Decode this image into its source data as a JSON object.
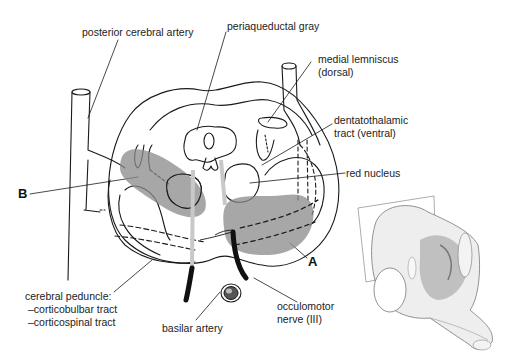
{
  "figure": {
    "labels": {
      "posterior_cerebral_artery": "posterior cerebral artery",
      "periaqueductal_gray": "periaqueductal gray",
      "medial_lemniscus_1": "medial lemniscus",
      "medial_lemniscus_2": "(dorsal)",
      "dentatothalamic_1": "dentatothalamic",
      "dentatothalamic_2": "tract (ventral)",
      "red_nucleus": "red nucleus",
      "letter_b": "B",
      "letter_a": "A",
      "cerebral_peduncle_1": "cerebral peduncle:",
      "cerebral_peduncle_2": "–corticobulbar tract",
      "cerebral_peduncle_3": "–corticospinal tract",
      "basilar_artery": "basilar artery",
      "oculomotor_1": "occulomotor",
      "oculomotor_2": "nerve (III)"
    },
    "colors": {
      "line": "#1a1a1a",
      "lesion_shade": "#8a8a8a",
      "nerve": "#111111",
      "pale_tract": "#c8c8c8",
      "background": "#ffffff"
    },
    "inset": {
      "description": "3D brainstem model with section plane"
    }
  }
}
